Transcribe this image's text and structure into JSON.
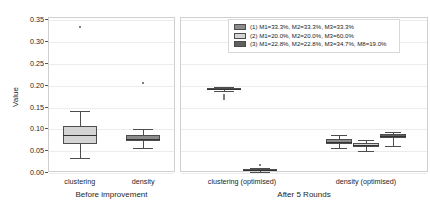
{
  "chart_data": {
    "type": "box",
    "title": "",
    "ylabel": "Value",
    "xlabel": "",
    "ylim": [
      0.0,
      0.355
    ],
    "yticks": [
      "0.00",
      "0.05",
      "0.10",
      "0.15",
      "0.20",
      "0.25",
      "0.30",
      "0.35"
    ],
    "ytick_values": [
      0.0,
      0.05,
      0.1,
      0.15,
      0.2,
      0.25,
      0.3,
      0.35
    ],
    "grid": "horizontal",
    "legend_position": "upper-right",
    "legend": [
      {
        "label": "(1) M1=33.3%, M2=33.3%, M3=33.3%",
        "color": "#8c8c8c"
      },
      {
        "label": "(2) M1=20.0%, M2=20.0%, M3=60.0%",
        "color": "#d4d4d4"
      },
      {
        "label": "(3) M1=22.8%, M2=22.8%, M3=34.7%, M8=19.0%",
        "color": "#5f5f5f"
      }
    ],
    "panels": [
      {
        "name": "Before improvement",
        "xticklabels": [
          "clustering",
          "density"
        ],
        "groups": [
          {
            "category": "clustering",
            "boxes": [
              {
                "series": "(1)",
                "color": "#d4d4d4",
                "whisker_low": 0.031,
                "q1": 0.063,
                "median": 0.084,
                "q3": 0.105,
                "whisker_high": 0.14,
                "fliers": [
                  0.331
                ]
              }
            ]
          },
          {
            "category": "density",
            "boxes": [
              {
                "series": "(1)",
                "color": "#8c8c8c",
                "whisker_low": 0.056,
                "q1": 0.07,
                "median": 0.076,
                "q3": 0.084,
                "whisker_high": 0.098,
                "fliers": [
                  0.203
                ]
              }
            ]
          }
        ]
      },
      {
        "name": "After 5 Rounds",
        "xticklabels": [
          "clustering (optimised)",
          "density (optimised)"
        ],
        "groups": [
          {
            "category": "clustering (optimised)",
            "boxes": [
              {
                "series": "(3)",
                "color": "#5f5f5f",
                "whisker_low": 0.186,
                "q1": 0.188,
                "median": 0.19,
                "q3": 0.192,
                "whisker_high": 0.194,
                "fliers": [
                  0.176,
                  0.172,
                  0.168
                ]
              },
              {
                "series": "(2)",
                "color": "#d4d4d4",
                "whisker_low": 0.0,
                "q1": 0.002,
                "median": 0.004,
                "q3": 0.007,
                "whisker_high": 0.01,
                "fliers": [
                  0.016
                ]
              }
            ]
          },
          {
            "category": "density (optimised)",
            "boxes": [
              {
                "series": "(1)",
                "color": "#8c8c8c",
                "whisker_low": 0.055,
                "q1": 0.063,
                "median": 0.068,
                "q3": 0.075,
                "whisker_high": 0.085,
                "fliers": []
              },
              {
                "series": "(2)",
                "color": "#d4d4d4",
                "whisker_low": 0.048,
                "q1": 0.057,
                "median": 0.062,
                "q3": 0.067,
                "whisker_high": 0.073,
                "fliers": []
              },
              {
                "series": "(3)",
                "color": "#5f5f5f",
                "whisker_low": 0.06,
                "q1": 0.077,
                "median": 0.082,
                "q3": 0.087,
                "whisker_high": 0.091,
                "fliers": []
              }
            ]
          }
        ]
      }
    ]
  }
}
